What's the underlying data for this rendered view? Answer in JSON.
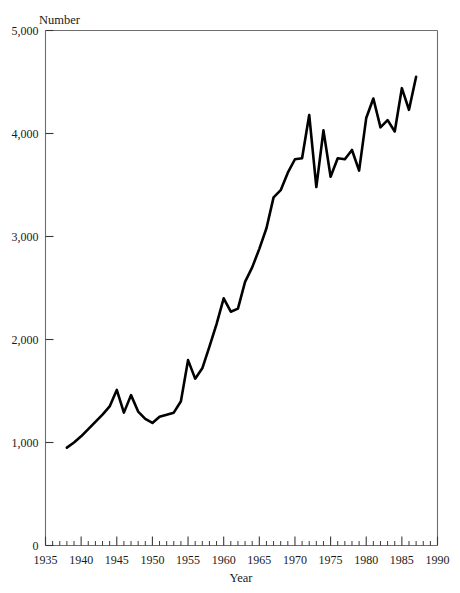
{
  "chart_data": {
    "type": "line",
    "title": "",
    "xlabel": "Year",
    "ylabel": "Number",
    "xlim": [
      1935,
      1990
    ],
    "ylim": [
      0,
      5000
    ],
    "grid": false,
    "legend": false,
    "x_major_ticks": [
      1935,
      1940,
      1945,
      1950,
      1955,
      1960,
      1965,
      1970,
      1975,
      1980,
      1985,
      1990
    ],
    "x_major_tick_labels": [
      "1935",
      "1940",
      "1945",
      "1950",
      "1955",
      "1960",
      "1965",
      "1970",
      "1975",
      "1980",
      "1985",
      "1990"
    ],
    "x_minor_tick_interval": 1,
    "y_major_ticks": [
      0,
      1000,
      2000,
      3000,
      4000,
      5000
    ],
    "y_major_tick_labels": [
      "0",
      "1,000",
      "2,000",
      "3,000",
      "4,000",
      "5,000"
    ],
    "series": [
      {
        "name": "Number",
        "color": "#000000",
        "x": [
          1938,
          1939,
          1940,
          1941,
          1942,
          1943,
          1944,
          1945,
          1946,
          1947,
          1948,
          1949,
          1950,
          1951,
          1952,
          1953,
          1954,
          1955,
          1956,
          1957,
          1958,
          1959,
          1960,
          1961,
          1962,
          1963,
          1964,
          1965,
          1966,
          1967,
          1968,
          1969,
          1970,
          1971,
          1972,
          1973,
          1974,
          1975,
          1976,
          1977,
          1978,
          1979,
          1980,
          1981,
          1982,
          1983,
          1984,
          1985,
          1986,
          1987
        ],
        "values": [
          950,
          1000,
          1060,
          1130,
          1200,
          1270,
          1350,
          1510,
          1290,
          1460,
          1300,
          1230,
          1190,
          1250,
          1270,
          1290,
          1400,
          1800,
          1620,
          1720,
          1930,
          2150,
          2400,
          2270,
          2300,
          2560,
          2700,
          2880,
          3080,
          3380,
          3450,
          3620,
          3750,
          3760,
          4180,
          3480,
          4030,
          3580,
          3760,
          3750,
          3840,
          3640,
          4150,
          4340,
          4060,
          4130,
          4020,
          4440,
          4230,
          4550
        ]
      }
    ]
  },
  "axes": {
    "ylabel": "Number",
    "xlabel": "Year"
  }
}
